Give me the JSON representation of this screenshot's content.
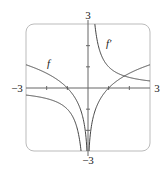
{
  "chart_data": {
    "type": "line",
    "title": "",
    "xlabel": "",
    "ylabel": "",
    "xlim": [
      -3,
      3
    ],
    "ylim": [
      -3,
      3
    ],
    "grid": false,
    "axis_labels": {
      "x_min": "−3",
      "x_max": "3",
      "y_min": "−3",
      "y_max": "3"
    },
    "ticks": {
      "x": [
        -2,
        -1,
        1,
        2
      ],
      "y": [
        -2,
        -1,
        1,
        2
      ]
    },
    "series": [
      {
        "name": "f",
        "label": "f",
        "expression": "ln|x|",
        "color": "#444444"
      },
      {
        "name": "f'",
        "label": "f′",
        "expression": "1/x",
        "color": "#444444"
      }
    ],
    "legend": "inline labels on curves"
  }
}
